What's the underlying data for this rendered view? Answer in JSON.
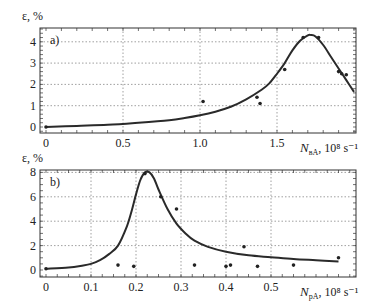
{
  "chart_data": [
    {
      "type": "line",
      "panel_label": "a)",
      "title": "",
      "ylabel": "ε, %",
      "xlabel": {
        "symbol": "N",
        "subscript": "вА",
        "units": ", 10⁸ s⁻¹"
      },
      "xlim": [
        0,
        2.05
      ],
      "ylim": [
        -0.2,
        4.6
      ],
      "xticks": [
        0,
        0.5,
        1.0,
        1.5
      ],
      "xtick_labels": [
        "0",
        "0.5",
        "1.0",
        "1.5"
      ],
      "yticks": [
        0,
        1,
        2,
        3,
        4
      ],
      "ytick_labels": [
        "0",
        "1",
        "2",
        "3",
        "4"
      ],
      "grid": true,
      "series": [
        {
          "name": "fit curve",
          "kind": "line",
          "x": [
            0,
            0.2,
            0.4,
            0.6,
            0.8,
            0.9,
            1.0,
            1.1,
            1.2,
            1.3,
            1.4,
            1.45,
            1.5,
            1.55,
            1.6,
            1.65,
            1.7,
            1.72,
            1.75,
            1.8,
            1.85,
            1.9,
            1.95,
            2.0
          ],
          "y": [
            0.0,
            0.05,
            0.1,
            0.2,
            0.32,
            0.42,
            0.55,
            0.72,
            0.95,
            1.3,
            1.75,
            2.05,
            2.5,
            3.0,
            3.6,
            4.05,
            4.3,
            4.32,
            4.25,
            3.85,
            3.3,
            2.75,
            2.2,
            1.65
          ]
        },
        {
          "name": "measured",
          "kind": "scatter",
          "x": [
            0.0,
            1.02,
            1.37,
            1.39,
            1.55,
            1.67,
            1.77,
            1.9,
            1.92,
            1.95
          ],
          "y": [
            0.0,
            1.2,
            1.4,
            1.1,
            2.7,
            4.2,
            4.2,
            2.6,
            2.5,
            2.45
          ]
        }
      ]
    },
    {
      "type": "line",
      "panel_label": "b)",
      "title": "",
      "ylabel": "ε, %",
      "xlabel": {
        "symbol": "N",
        "subscript": "pA",
        "units": ", 10⁸ s⁻¹"
      },
      "xlim": [
        0,
        0.68
      ],
      "ylim": [
        -0.5,
        8.3
      ],
      "xticks": [
        0,
        0.1,
        0.2,
        0.3,
        0.4,
        0.5
      ],
      "xtick_labels": [
        "0",
        "0.1",
        "0.2",
        "0.3",
        "0.4",
        "0.5"
      ],
      "yticks": [
        0,
        2,
        4,
        6,
        8
      ],
      "ytick_labels": [
        "0",
        "2",
        "4",
        "6",
        "8"
      ],
      "grid": true,
      "series": [
        {
          "name": "fit curve",
          "kind": "line",
          "x": [
            0,
            0.05,
            0.08,
            0.1,
            0.12,
            0.14,
            0.16,
            0.18,
            0.19,
            0.2,
            0.21,
            0.22,
            0.23,
            0.24,
            0.25,
            0.27,
            0.29,
            0.31,
            0.33,
            0.36,
            0.4,
            0.45,
            0.5,
            0.55,
            0.6,
            0.65
          ],
          "y": [
            0.1,
            0.2,
            0.35,
            0.5,
            0.8,
            1.3,
            2.0,
            3.6,
            4.8,
            6.2,
            7.4,
            8.0,
            8.0,
            7.5,
            6.6,
            5.0,
            3.8,
            3.0,
            2.4,
            1.9,
            1.5,
            1.2,
            1.05,
            0.9,
            0.8,
            0.7
          ]
        },
        {
          "name": "measured",
          "kind": "scatter",
          "x": [
            0.0,
            0.16,
            0.195,
            0.22,
            0.255,
            0.29,
            0.33,
            0.4,
            0.41,
            0.44,
            0.47,
            0.55,
            0.65
          ],
          "y": [
            0.1,
            0.4,
            0.3,
            7.9,
            6.0,
            5.0,
            0.4,
            0.3,
            0.4,
            1.9,
            0.3,
            0.4,
            1.0
          ]
        }
      ]
    }
  ]
}
